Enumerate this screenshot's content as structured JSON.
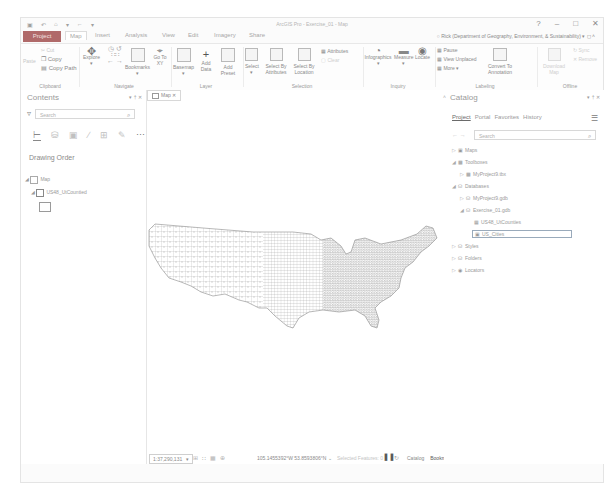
{
  "window": {
    "title": "ArcGIS Pro - Exercise_01 - Map",
    "controls": [
      "?",
      "–",
      "□",
      "✕"
    ],
    "user": "Rick (Department of Geography, Environment, & Sustainability) ▾"
  },
  "quick_access": [
    "▣",
    "↶",
    "⌂",
    "▾",
    "←",
    "▾"
  ],
  "tabs": [
    {
      "label": "Project"
    },
    {
      "label": "Map",
      "active": true
    },
    {
      "label": "Insert"
    },
    {
      "label": "Analysis"
    },
    {
      "label": "View"
    },
    {
      "label": "Edit"
    },
    {
      "label": "Imagery"
    },
    {
      "label": "Share"
    }
  ],
  "ribbon": {
    "clipboard": {
      "label": "Clipboard",
      "paste": "Paste",
      "cut": "Cut",
      "copy": "Copy",
      "copy_path": "Copy Path"
    },
    "navigate": {
      "label": "Navigate",
      "explore": "Explore",
      "bookmarks": "Bookmarks",
      "go_to_xy": "Go To XY"
    },
    "layer": {
      "label": "Layer",
      "basemap": "Basemap",
      "add_data": "Add Data",
      "add_preset": "Add Preset"
    },
    "selection": {
      "label": "Selection",
      "select": "Select",
      "select_by_attributes": "Select By Attributes",
      "select_by_location": "Select By Location",
      "attributes": "Attributes",
      "clear": "Clear"
    },
    "inquiry": {
      "label": "Inquiry",
      "infographics": "Infographics",
      "measure": "Measure",
      "locate": "Locate"
    },
    "labeling": {
      "label": "Labeling",
      "pause": "Pause",
      "view_unplaced": "View Unplaced",
      "more": "More",
      "convert_to_annotation": "Convert To Annotation"
    },
    "offline": {
      "label": "Offline",
      "download_map": "Download Map",
      "sync": "Sync",
      "remove": "Remove"
    }
  },
  "contents": {
    "title": "Contents",
    "controls": "▾ † ✕",
    "search_placeholder": "Search",
    "drawing_order": "Drawing Order",
    "layers": [
      {
        "label": "Map"
      },
      {
        "label": "US48_UtCountied"
      }
    ]
  },
  "map": {
    "tab_label": "Map",
    "status": {
      "scale": "1:37,290,131",
      "coordinates": "105.1455392°W 53.8593806°N",
      "selected_features": "Selected Features: 0",
      "pane_tabs": [
        "Catalog",
        "Bookmarks"
      ],
      "active_pane_tab": "Bookmarks"
    }
  },
  "catalog": {
    "title": "Catalog",
    "controls": "▾ † ✕",
    "tabs": [
      "Project",
      "Portal",
      "Favorites",
      "History"
    ],
    "active_tab": "Project",
    "search_placeholder": "Search",
    "tree": [
      {
        "label": "Maps",
        "level": 0,
        "expanded": false
      },
      {
        "label": "Toolboxes",
        "level": 0,
        "expanded": true
      },
      {
        "label": "MyProject9.tbx",
        "level": 1
      },
      {
        "label": "Databases",
        "level": 0,
        "expanded": true
      },
      {
        "label": "MyProject9.gdb",
        "level": 1
      },
      {
        "label": "Exercise_01.gdb",
        "level": 1,
        "expanded": true
      },
      {
        "label": "US48_UtCounties",
        "level": 2
      },
      {
        "label": "US_Cities",
        "level": 2,
        "selected": true
      },
      {
        "label": "Styles",
        "level": 0
      },
      {
        "label": "Folders",
        "level": 0
      },
      {
        "label": "Locators",
        "level": 0
      }
    ]
  },
  "colors": {
    "project_tab": "#b06a6a",
    "map_lines": "#8a8a8a"
  }
}
